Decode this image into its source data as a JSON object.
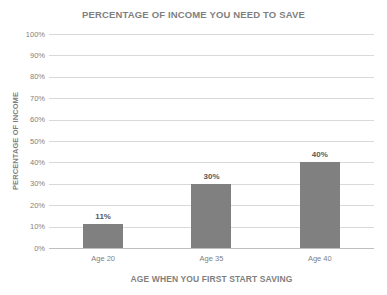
{
  "chart_data": {
    "type": "bar",
    "title": "PERCENTAGE OF INCOME YOU NEED TO SAVE",
    "xlabel": "AGE WHEN YOU FIRST START SAVING",
    "ylabel": "PERCENTAGE OF INCOME",
    "categories": [
      "Age 20",
      "Age 35",
      "Age 40"
    ],
    "values": [
      11,
      30,
      40
    ],
    "data_labels": [
      "11%",
      "30%",
      "40%"
    ],
    "ylim": [
      0,
      100
    ],
    "ytick_values": [
      100,
      90,
      80,
      70,
      60,
      50,
      40,
      30,
      20,
      10,
      0
    ],
    "ytick_labels": [
      "100%",
      "90%",
      "80%",
      "70%",
      "60%",
      "50%",
      "40%",
      "30%",
      "20%",
      "10%",
      "0%"
    ],
    "grid": true,
    "legend": false,
    "bar_color": "#808080",
    "gridline_color": "#d9d9d9",
    "text_color": "#7f7f7f",
    "background_color": "#ffffff"
  }
}
